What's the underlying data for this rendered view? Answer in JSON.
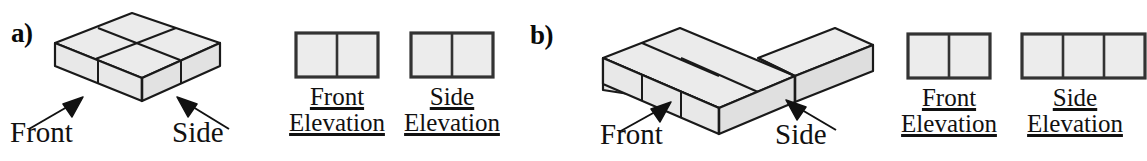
{
  "figure": {
    "background_color": "#ffffff",
    "stroke_color": "#1a1a1a",
    "face_fill_top": "#ebebeb",
    "face_fill_front": "#e8e8e8",
    "face_fill_side": "#e0e0e0",
    "elevation_fill": "#ececec"
  },
  "parts": [
    {
      "label": "a)",
      "solid": {
        "name": "2x2x1-cube-block",
        "cubes_wide": 2,
        "cubes_deep": 2,
        "cubes_high": 1
      },
      "direction_labels": {
        "front": "Front",
        "side": "Side"
      },
      "elevations": [
        {
          "name": "front-elevation",
          "caption_line1": "Front",
          "caption_line2": "Elevation",
          "cells_across": 2,
          "cells_down": 1
        },
        {
          "name": "side-elevation",
          "caption_line1": "Side",
          "caption_line2": "Elevation",
          "cells_across": 2,
          "cells_down": 1
        }
      ]
    },
    {
      "label": "b)",
      "solid": {
        "name": "l-shaped-cube-block",
        "description": "three cubes in a row with one cube behind the right end",
        "cubes_total": 4,
        "cubes_high": 1
      },
      "direction_labels": {
        "front": "Front",
        "side": "Side"
      },
      "elevations": [
        {
          "name": "front-elevation",
          "caption_line1": "Front",
          "caption_line2": "Elevation",
          "cells_across": 2,
          "cells_down": 1
        },
        {
          "name": "side-elevation",
          "caption_line1": "Side",
          "caption_line2": "Elevation",
          "cells_across": 3,
          "cells_down": 1
        }
      ]
    }
  ]
}
